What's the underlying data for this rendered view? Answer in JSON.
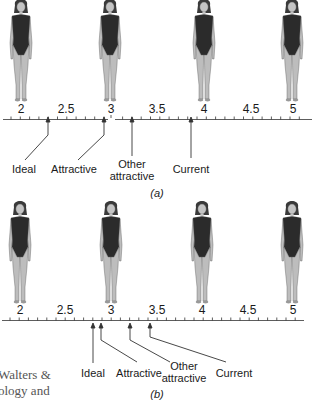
{
  "figure": {
    "panels": [
      {
        "id": "a",
        "caption": "(a)",
        "figures": [
          {
            "scale_value": 2
          },
          {
            "scale_value": 3
          },
          {
            "scale_value": 4
          },
          {
            "scale_value": 5
          }
        ],
        "scale_labels": [
          "2",
          "2.5",
          "3",
          "3.5",
          "4",
          "4.5",
          "5"
        ],
        "markers": [
          {
            "label": "Ideal",
            "value": 2.3
          },
          {
            "label": "Attractive",
            "value": 2.9
          },
          {
            "label": "Other attractive",
            "value": 3.2
          },
          {
            "label": "Current",
            "value": 3.85
          }
        ]
      },
      {
        "id": "b",
        "caption": "(b)",
        "figures": [
          {
            "scale_value": 2
          },
          {
            "scale_value": 3
          },
          {
            "scale_value": 4
          },
          {
            "scale_value": 5
          }
        ],
        "scale_labels": [
          "2",
          "2.5",
          "3",
          "3.5",
          "4",
          "4.5",
          "5"
        ],
        "markers": [
          {
            "label": "Ideal",
            "value": 2.8
          },
          {
            "label": "Attractive",
            "value": 2.9
          },
          {
            "label": "Other attractive",
            "value": 3.2
          },
          {
            "label": "Current",
            "value": 3.4
          }
        ]
      }
    ],
    "side_text": {
      "line1": "Walters &",
      "line2": "ology and"
    }
  },
  "labels": {
    "a": {
      "t2": "2",
      "t25": "2.5",
      "t3": "3",
      "t35": "3.5",
      "t4": "4",
      "t45": "4.5",
      "t5": "5",
      "ideal": "Ideal",
      "attractive": "Attractive",
      "other1": "Other",
      "other2": "attractive",
      "current": "Current",
      "caption": "(a)"
    },
    "b": {
      "t2": "2",
      "t25": "2.5",
      "t3": "3",
      "t35": "3.5",
      "t4": "4",
      "t45": "4.5",
      "t5": "5",
      "ideal": "Ideal",
      "attractive": "Attractive",
      "other1": "Other",
      "other2": "attractive",
      "current": "Current",
      "caption": "(b)"
    }
  },
  "colors": {
    "skin": "#b9b9b9",
    "swimsuit": "#2b2b2b",
    "hair": "#3a3a3a",
    "line": "#333333"
  }
}
